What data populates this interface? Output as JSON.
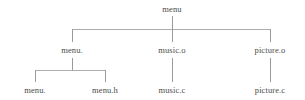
{
  "diagram": {
    "type": "tree",
    "levels": 3,
    "stroke_color": "#9a9a9a",
    "text_color": "#4a4a4a",
    "background_color": "#ffffff",
    "nodes": {
      "root": {
        "label": "menu",
        "level": 0
      },
      "level1": [
        {
          "label": "menu.",
          "level": 1
        },
        {
          "label": "music.o",
          "level": 1
        },
        {
          "label": "picture.o",
          "level": 1
        }
      ],
      "level2": [
        {
          "label": "menu.",
          "level": 2,
          "parent": "menu."
        },
        {
          "label": "menu.h",
          "level": 2,
          "parent": "menu."
        },
        {
          "label": "music.c",
          "level": 2,
          "parent": "music.o"
        },
        {
          "label": "picture.c",
          "level": 2,
          "parent": "picture.o"
        }
      ]
    }
  }
}
